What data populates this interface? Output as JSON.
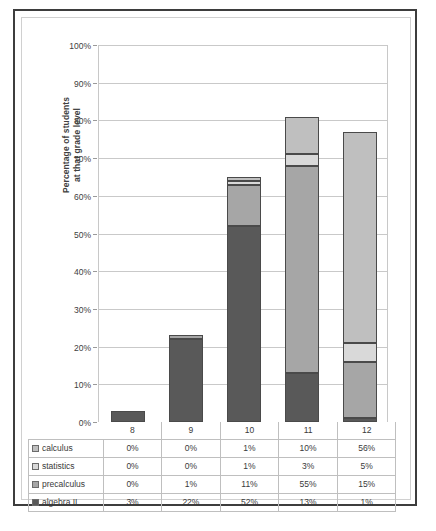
{
  "chart_data": {
    "type": "bar",
    "stacked": true,
    "title": "",
    "xlabel": "",
    "ylabel": "Percentage of students at that grade level",
    "ylabel_line1": "Percentage of students",
    "ylabel_line2": "at that grade level",
    "categories": [
      "8",
      "9",
      "10",
      "11",
      "12"
    ],
    "ylim": [
      0,
      100
    ],
    "grid": true,
    "legend_position": "table-row-headers",
    "ytick_labels": [
      "0%",
      "10%",
      "20%",
      "30%",
      "40%",
      "50%",
      "60%",
      "70%",
      "80%",
      "90%",
      "100%"
    ],
    "ytick_values": [
      0,
      10,
      20,
      30,
      40,
      50,
      60,
      70,
      80,
      90,
      100
    ],
    "stack_order_bottom_to_top": [
      "algebra II",
      "precalculus",
      "statistics",
      "calculus"
    ],
    "series": [
      {
        "name": "calculus",
        "color": "#bfbfbf",
        "values": [
          0,
          0,
          1,
          10,
          56
        ],
        "labels": [
          "0%",
          "0%",
          "1%",
          "10%",
          "56%"
        ]
      },
      {
        "name": "statistics",
        "color": "#d9d9d9",
        "values": [
          0,
          0,
          1,
          3,
          5
        ],
        "labels": [
          "0%",
          "0%",
          "1%",
          "3%",
          "5%"
        ]
      },
      {
        "name": "precalculus",
        "color": "#a6a6a6",
        "values": [
          0,
          1,
          11,
          55,
          15
        ],
        "labels": [
          "0%",
          "1%",
          "11%",
          "55%",
          "15%"
        ]
      },
      {
        "name": "algebra II",
        "color": "#595959",
        "values": [
          3,
          22,
          52,
          13,
          1
        ],
        "labels": [
          "3%",
          "22%",
          "52%",
          "13%",
          "1%"
        ]
      }
    ],
    "totals": [
      3,
      23,
      65,
      81,
      77
    ]
  },
  "table": {
    "grade_header": [
      "8",
      "9",
      "10",
      "11",
      "12"
    ],
    "rows": [
      {
        "label": "calculus",
        "values": [
          "0%",
          "0%",
          "1%",
          "10%",
          "56%"
        ]
      },
      {
        "label": "statistics",
        "values": [
          "0%",
          "0%",
          "1%",
          "3%",
          "5%"
        ]
      },
      {
        "label": "precalculus",
        "values": [
          "0%",
          "1%",
          "11%",
          "55%",
          "15%"
        ]
      },
      {
        "label": "algebra II",
        "values": [
          "3%",
          "22%",
          "52%",
          "13%",
          "1%"
        ]
      }
    ]
  },
  "colors": {
    "calculus": "#bfbfbf",
    "statistics": "#d9d9d9",
    "precalculus": "#a6a6a6",
    "algebra_ii": "#595959",
    "frame": "#3d3d3d",
    "gridline": "#c9c9c9",
    "text": "#404040"
  }
}
